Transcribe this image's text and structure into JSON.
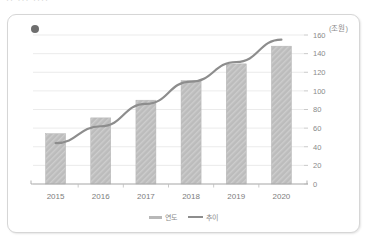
{
  "clipped_heading": "··  ···  ····",
  "card": {
    "dot_color": "#6e6e6e",
    "border_color": "#d6d6d6"
  },
  "legend": {
    "items": [
      {
        "label": "연도",
        "type": "bar",
        "color": "#b8b8b8"
      },
      {
        "label": "추이",
        "type": "line",
        "color": "#8d8d8d"
      }
    ]
  },
  "chart_data": {
    "type": "bar",
    "title": "",
    "xlabel": "",
    "ylabel": "(조원)",
    "unit_label": "(조원)",
    "categories": [
      "2015",
      "2016",
      "2017",
      "2018",
      "2019",
      "2020"
    ],
    "ylim": [
      0,
      160
    ],
    "yticks": [
      0,
      20,
      40,
      60,
      80,
      100,
      120,
      140,
      160
    ],
    "ytick_labels": [
      "0",
      "20",
      "40",
      "60",
      "80",
      "100",
      "120",
      "140",
      "160"
    ],
    "grid": true,
    "legend_position": "bottom",
    "series": [
      {
        "name": "연도",
        "type": "bar",
        "color": "#b8b8b8",
        "pattern": "diagonal-hatch",
        "values": [
          54,
          71,
          90,
          111,
          129,
          148
        ]
      },
      {
        "name": "추이",
        "type": "line",
        "color": "#8d8d8d",
        "values": [
          44,
          62,
          86,
          110,
          131,
          155
        ]
      }
    ]
  }
}
